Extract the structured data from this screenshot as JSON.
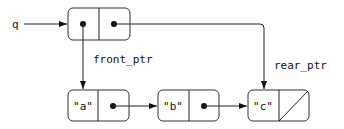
{
  "diagram": {
    "variable": "q",
    "queue_pair": {
      "car": "pointer",
      "cdr": "pointer"
    },
    "labels": {
      "front": "front_ptr",
      "rear": "rear_ptr"
    },
    "list": [
      {
        "value": "\"a\"",
        "next": "pointer"
      },
      {
        "value": "\"b\"",
        "next": "pointer"
      },
      {
        "value": "\"c\"",
        "next": "null"
      }
    ]
  }
}
